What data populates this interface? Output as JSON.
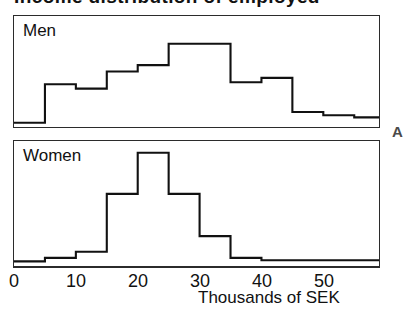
{
  "figure": {
    "title_cropped": "Income distribution of employed",
    "panel_letter": "A",
    "xaxis_title": "Thousands of SEK",
    "tick_labels": [
      "0",
      "10",
      "20",
      "30",
      "40",
      "50"
    ],
    "tick_values": [
      0,
      10,
      20,
      30,
      40,
      50
    ],
    "ink_color": "#111111",
    "frame_color": "#2b2b2b",
    "background_color": "#ffffff"
  },
  "panels": [
    {
      "key": "men",
      "label": "Men"
    },
    {
      "key": "women",
      "label": "Women"
    }
  ],
  "chart_data": {
    "type": "bar",
    "title": "Income distribution of employed",
    "xlabel": "Thousands of SEK",
    "ylabel": "",
    "xlim": [
      0,
      59
    ],
    "grid": false,
    "legend": "none",
    "bin_width": 5,
    "bin_edges": [
      0,
      5,
      10,
      15,
      20,
      25,
      30,
      35,
      40,
      45,
      50,
      55,
      59
    ],
    "categories": [
      "0-5",
      "5-10",
      "10-15",
      "15-20",
      "20-25",
      "25-30",
      "30-35",
      "35-40",
      "40-45",
      "45-50",
      "50-55",
      "55-59"
    ],
    "series": [
      {
        "name": "Men",
        "ylim": [
          0,
          100
        ],
        "values": [
          2,
          38,
          34,
          50,
          56,
          76,
          76,
          40,
          44,
          12,
          9,
          7
        ]
      },
      {
        "name": "Women",
        "ylim": [
          0,
          100
        ],
        "values": [
          2,
          5,
          10,
          58,
          92,
          58,
          23,
          5,
          3,
          3,
          3,
          3
        ]
      }
    ]
  }
}
